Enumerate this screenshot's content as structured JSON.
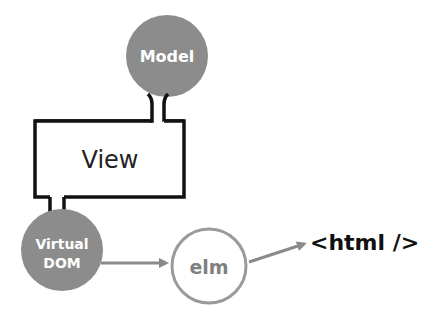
{
  "diagram": {
    "nodes": {
      "model": {
        "label": "Model"
      },
      "view": {
        "label": "View"
      },
      "virtual_dom": {
        "line1": "Virtual",
        "line2": "DOM"
      },
      "elm": {
        "label": "elm"
      },
      "html": {
        "label": "<html />"
      }
    },
    "edges": [
      {
        "from": "model",
        "to": "view",
        "style": "connector"
      },
      {
        "from": "view",
        "to": "virtual_dom",
        "style": "connector"
      },
      {
        "from": "virtual_dom",
        "to": "elm",
        "style": "arrow"
      },
      {
        "from": "elm",
        "to": "html",
        "style": "arrow"
      }
    ],
    "colors": {
      "filled_node": "#8c8c8c",
      "outline_node": "#9a9a9a",
      "stroke": "#111111",
      "arrow": "#8a8a8a",
      "text_light": "#ffffff",
      "text_dark": "#222222",
      "elm_text": "#808080"
    }
  }
}
